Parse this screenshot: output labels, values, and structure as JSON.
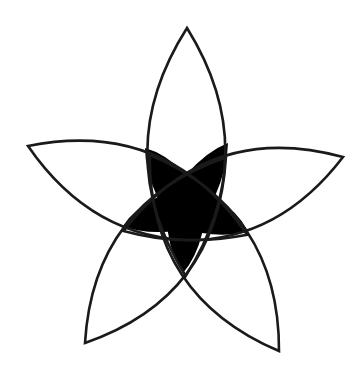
{
  "figure": {
    "stroke_color": "#1a1a1a",
    "fill_color": "#000000",
    "background": "#ffffff",
    "center": [
      186,
      210
    ],
    "petals": [
      {
        "name": "top",
        "tip": [
          187,
          28
        ]
      },
      {
        "name": "right",
        "tip": [
          343,
          157
        ]
      },
      {
        "name": "bottom-right",
        "tip": [
          279,
          351
        ]
      },
      {
        "name": "bottom-left",
        "tip": [
          85,
          343
        ]
      },
      {
        "name": "left",
        "tip": [
          28,
          146
        ]
      }
    ],
    "star_points": [
      [
        145,
        148
      ],
      [
        228,
        143
      ],
      [
        248,
        231
      ],
      [
        183,
        273
      ],
      [
        123,
        226
      ]
    ]
  }
}
